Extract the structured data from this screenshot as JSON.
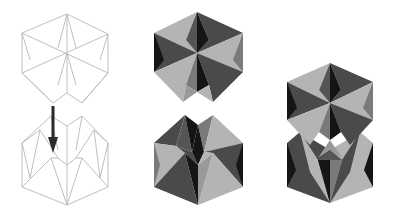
{
  "figure": {
    "title": "",
    "panels": [
      {
        "id": "wireframe-top",
        "description": "Line drawing of hexagonal folded unit, upper half"
      },
      {
        "id": "wireframe-bottom",
        "description": "Line drawing of hexagonal folded unit, lower half, with arrow indicating insertion"
      },
      {
        "id": "shaded-top",
        "description": "Shaded upper folded unit"
      },
      {
        "id": "shaded-bottom",
        "description": "Shaded lower folded unit"
      },
      {
        "id": "assembled",
        "description": "Shaded assembled unit, both halves joined"
      }
    ]
  },
  "colors": {
    "wire": "#b8b8b8",
    "light": "#b4b4b4",
    "mid": "#7a7a7a",
    "dark": "#4a4a4a",
    "black": "#151515",
    "arrow": "#2a2a2a"
  },
  "arrow": {
    "x": 53,
    "y1": 106,
    "y2": 152,
    "direction": "down"
  }
}
